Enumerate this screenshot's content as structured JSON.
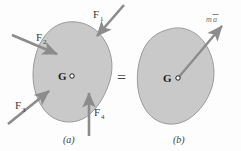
{
  "figure": {
    "background_color": "#fdfdfd",
    "body_fill_color": "#c9c9c9",
    "body_stroke_color": "#9a9a9a",
    "arrow_color": "#8c8c8c",
    "label_color": "#3a3a3a"
  },
  "panel_a": {
    "caption": "(a)",
    "center_label": "G",
    "forces": [
      {
        "name": "F1",
        "label": "F",
        "subscript": "1",
        "direction": "down-left",
        "label_x": 93,
        "label_y": 17
      },
      {
        "name": "F2",
        "label": "F",
        "subscript": "2",
        "direction": "down-right",
        "label_x": 36,
        "label_y": 40
      },
      {
        "name": "F3",
        "label": "F",
        "subscript": "3",
        "direction": "up-right",
        "label_x": 16,
        "label_y": 109
      },
      {
        "name": "F4",
        "label": "F",
        "subscript": "4",
        "direction": "up",
        "label_x": 94,
        "label_y": 116
      }
    ]
  },
  "panel_b": {
    "caption": "(b)",
    "center_label": "G",
    "resultant": {
      "name": "ma-vector",
      "label_m": "m",
      "label_a": "a",
      "overbar": true,
      "direction": "up-right",
      "label_x": 207,
      "label_y": 20
    }
  },
  "relation": {
    "operator": "=",
    "operator_x": 122,
    "operator_y": 80
  }
}
